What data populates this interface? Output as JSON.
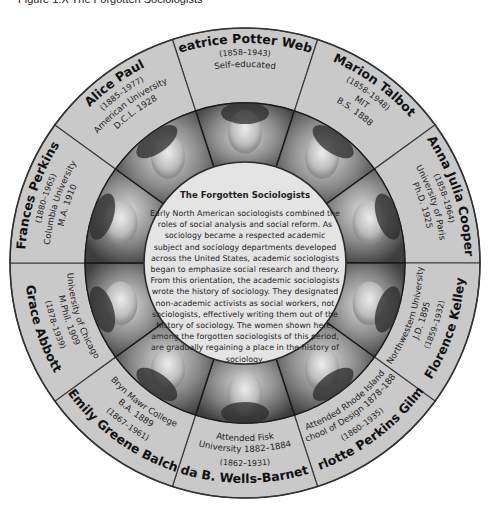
{
  "caption": "Figure 1.X The Forgotten Sociologists",
  "center": {
    "title": "The Forgotten Sociologists",
    "body": "Early North American sociologists combined the roles of social analysis and social reform. As sociology became a respected academic subject and sociology departments developed across the United States, academic sociologists began to emphasize social research and theory. From this orientation, the academic sociologists wrote the history of sociology. They designated non-academic activists as social workers, not sociologists, effectively writing them out of the history of sociology. The women shown here, among the forgotten sociologists of this period, are gradually regaining a place in the history of sociology."
  },
  "colors": {
    "ring": "#c9c9c9",
    "ring_stroke": "#3a3a3a",
    "center": "#e4e4e4",
    "text": "#111111"
  },
  "sociologists": [
    {
      "name": "Beatrice Potter Webb",
      "years": "(1858–1943)",
      "education": [
        "Self–educated"
      ]
    },
    {
      "name": "Marion Talbot",
      "years": "(1858–1948)",
      "education": [
        "MIT",
        "B.S. 1888"
      ]
    },
    {
      "name": "Anna Julia Cooper",
      "years": "(1858–1964)",
      "education": [
        "University of Paris",
        "Ph.D. 1925"
      ]
    },
    {
      "name": "Florence Kelley",
      "years": "(1859–1932)",
      "education": [
        "Northwestern University",
        "J.D. 1895"
      ]
    },
    {
      "name": "Charlotte Perkins Gilman",
      "years": "(1860–1935)",
      "education": [
        "Attended Rhode Island",
        "School of Design 1878–1880"
      ]
    },
    {
      "name": "Ida B. Wells-Barnett",
      "years": "(1862–1931)",
      "education": [
        "Attended Fisk",
        "University 1882–1884"
      ]
    },
    {
      "name": "Emily Greene Balch",
      "years": "(1867–1961)",
      "education": [
        "Bryn Mawr College",
        "B.A. 1889"
      ]
    },
    {
      "name": "Grace Abbott",
      "years": "(1878–1939)",
      "education": [
        "University of Chicago",
        "M.Phil. 1909"
      ]
    },
    {
      "name": "Frances Perkins",
      "years": "(1880–1965)",
      "education": [
        "Columbia University",
        "M.A. 1910"
      ]
    },
    {
      "name": "Alice Paul",
      "years": "(1885–1977)",
      "education": [
        "American University",
        "D.C.L. 1928"
      ]
    }
  ]
}
